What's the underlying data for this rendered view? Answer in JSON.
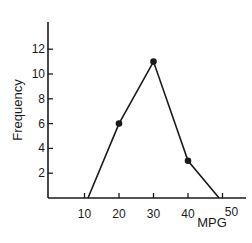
{
  "chart_data": {
    "type": "line",
    "title": "",
    "xlabel": "MPG",
    "ylabel": "Frequency",
    "x_ticks": [
      10,
      20,
      30,
      40,
      50
    ],
    "y_ticks": [
      2,
      4,
      6,
      8,
      10,
      12
    ],
    "xlim": [
      4,
      56
    ],
    "ylim": [
      0,
      14
    ],
    "grid": false,
    "series": [
      {
        "name": "Frequency polygon",
        "points": [
          {
            "x": 11,
            "y": 0,
            "marker": false
          },
          {
            "x": 20,
            "y": 6,
            "marker": true
          },
          {
            "x": 30,
            "y": 11,
            "marker": true
          },
          {
            "x": 40,
            "y": 3,
            "marker": true
          },
          {
            "x": 49,
            "y": 0,
            "marker": false
          }
        ]
      }
    ]
  },
  "colors": {
    "ink": "#1a1a1a",
    "background": "#ffffff"
  }
}
